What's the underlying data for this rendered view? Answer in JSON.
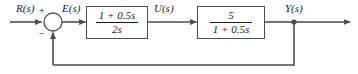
{
  "diagram": {
    "type": "control-system-block-diagram",
    "line_color": "#4d4d4d",
    "text_color": "#1a1a1a",
    "background": "#ffffff"
  },
  "signals": {
    "input": "R(s)",
    "error": "E(s)",
    "control": "U(s)",
    "output": "Y(s)"
  },
  "summing_junction": {
    "name": "summing-junction",
    "positive_sign": "+",
    "negative_sign": "−",
    "positive_input": "R(s)",
    "negative_input": "Y(s)"
  },
  "blocks": [
    {
      "name": "controller",
      "numerator": "1 + 0.5s",
      "denominator": "2s",
      "input": "E(s)",
      "output": "U(s)"
    },
    {
      "name": "plant",
      "numerator": "5",
      "denominator": "1 + 0.5s",
      "input": "U(s)",
      "output": "Y(s)"
    }
  ],
  "feedback": {
    "name": "unity-feedback-path",
    "gain": "1",
    "from": "Y(s)",
    "to": "summing-junction"
  }
}
